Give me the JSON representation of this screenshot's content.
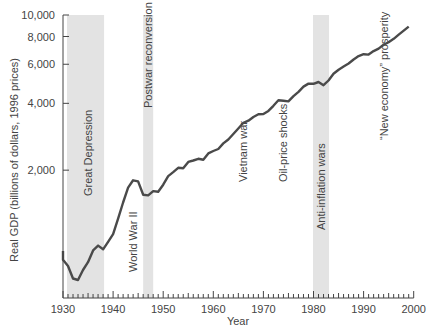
{
  "chart_data": {
    "type": "line",
    "title": "",
    "xlabel": "Year",
    "ylabel": "Real GDP (billions of dollars, 1996 prices)",
    "yscale": "log",
    "xlim": [
      1930,
      2000
    ],
    "ylim": [
      415,
      10000
    ],
    "grid": false,
    "legend": null,
    "x_ticks": [
      1930,
      1940,
      1950,
      1960,
      1970,
      1980,
      1990,
      2000
    ],
    "x_tick_labels": [
      "1930",
      "1940",
      "1950",
      "1960",
      "1970",
      "1980",
      "1990",
      "2000"
    ],
    "y_ticks": [
      2000,
      4000,
      6000,
      8000,
      10000
    ],
    "y_tick_labels": [
      "2,000",
      "4,000",
      "6,000",
      "8,000",
      "10,000"
    ],
    "series": [
      {
        "name": "Real GDP",
        "x": [
          1929,
          1930,
          1931,
          1932,
          1933,
          1934,
          1935,
          1936,
          1937,
          1938,
          1939,
          1940,
          1941,
          1942,
          1943,
          1944,
          1945,
          1946,
          1947,
          1948,
          1949,
          1950,
          1951,
          1952,
          1953,
          1954,
          1955,
          1956,
          1957,
          1958,
          1959,
          1960,
          1961,
          1962,
          1963,
          1964,
          1965,
          1966,
          1967,
          1968,
          1969,
          1970,
          1971,
          1972,
          1973,
          1974,
          1975,
          1976,
          1977,
          1978,
          1979,
          1980,
          1981,
          1982,
          1983,
          1984,
          1985,
          1986,
          1987,
          1988,
          1989,
          1990,
          1991,
          1992,
          1993,
          1994,
          1995,
          1996,
          1997,
          1998,
          1999
        ],
        "values": [
          865,
          790,
          740,
          650,
          640,
          710,
          770,
          870,
          915,
          880,
          950,
          1030,
          1210,
          1430,
          1670,
          1800,
          1780,
          1550,
          1540,
          1610,
          1600,
          1720,
          1880,
          1960,
          2050,
          2040,
          2180,
          2210,
          2250,
          2230,
          2380,
          2440,
          2490,
          2640,
          2750,
          2910,
          3080,
          3270,
          3340,
          3470,
          3570,
          3580,
          3700,
          3900,
          4130,
          4110,
          4080,
          4310,
          4510,
          4760,
          4910,
          4900,
          4990,
          4830,
          5070,
          5440,
          5670,
          5860,
          6050,
          6300,
          6530,
          6660,
          6630,
          6880,
          7060,
          7340,
          7540,
          7810,
          8160,
          8510,
          8870
        ]
      }
    ],
    "shaded_periods": [
      {
        "label": "Great Depression",
        "start": 1930.8,
        "end": 1938.2
      },
      {
        "label": "Postwar reconversion",
        "start": 1946.0,
        "end": 1948.0
      },
      {
        "label": "Anti-inflation wars",
        "start": 1979.9,
        "end": 1983.1
      }
    ],
    "annotations": [
      {
        "text": "Great Depression",
        "x": 1935,
        "rotation": -90
      },
      {
        "text": "World War II",
        "x": 1944,
        "rotation": -90
      },
      {
        "text": "Postwar reconversion",
        "x": 1947,
        "rotation": -90
      },
      {
        "text": "Vietnam war",
        "x": 1966,
        "rotation": -90
      },
      {
        "text": "Oil-price shocks",
        "x": 1974,
        "rotation": -90
      },
      {
        "text": "Anti-inflation wars",
        "x": 1981.5,
        "rotation": -90
      },
      {
        "text": "“New economy” prosperity",
        "x": 1994,
        "rotation": -90
      }
    ]
  },
  "colors": {
    "line": "#4a4a4a",
    "shade": "#e3e3e3",
    "axis": "#444444",
    "text": "#444444"
  }
}
